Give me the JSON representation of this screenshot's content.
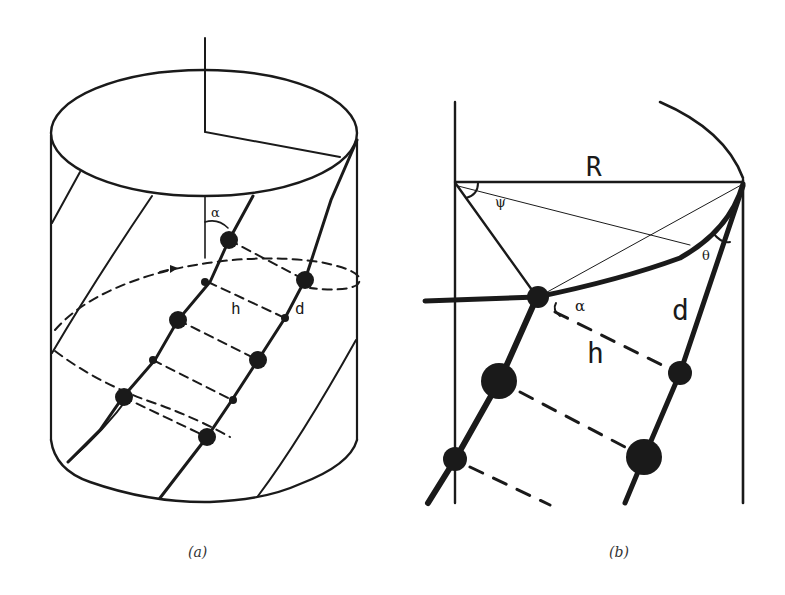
{
  "figure": {
    "panels": [
      {
        "id": "a",
        "caption": "(a)",
        "description": "Cylinder with helical strands of beads",
        "labels": {
          "alpha": "α",
          "h": "h",
          "d": "d"
        }
      },
      {
        "id": "b",
        "caption": "(b)",
        "description": "Close-up geometry of helix on cylinder",
        "labels": {
          "R": "R",
          "psi": "ψ",
          "theta": "θ",
          "alpha": "α",
          "d": "d",
          "h": "h"
        }
      }
    ],
    "colors": {
      "ink": "#1a1a1a",
      "background": "#ffffff"
    }
  }
}
